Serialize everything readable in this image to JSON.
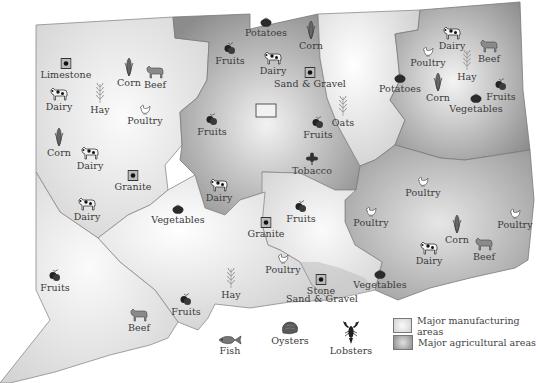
{
  "map": {
    "colors": {
      "manufacturing_fill_center": "#fafafa",
      "manufacturing_fill_edge": "#d0d0d0",
      "agricultural_fill_center": "#eeeeee",
      "agricultural_fill_edge": "#8a8a8a",
      "border": "#888888",
      "label": "#3a3a3a"
    },
    "resources": [
      {
        "label": "Limestone",
        "icon": "mine-square-icon",
        "x": 66,
        "y": 70
      },
      {
        "label": "Corn",
        "icon": "corn-icon",
        "x": 129,
        "y": 78
      },
      {
        "label": "Beef",
        "icon": "cow-beef-icon",
        "x": 155,
        "y": 80
      },
      {
        "label": "Dairy",
        "icon": "cow-dairy-icon",
        "x": 59,
        "y": 102
      },
      {
        "label": "Hay",
        "icon": "wheat-icon",
        "x": 100,
        "y": 105
      },
      {
        "label": "Poultry",
        "icon": "chicken-icon",
        "x": 145,
        "y": 116
      },
      {
        "label": "Corn",
        "icon": "corn-icon",
        "x": 59,
        "y": 148
      },
      {
        "label": "Dairy",
        "icon": "cow-dairy-icon",
        "x": 90,
        "y": 161
      },
      {
        "label": "Granite",
        "icon": "mine-square-icon",
        "x": 133,
        "y": 182
      },
      {
        "label": "Dairy",
        "icon": "cow-dairy-icon",
        "x": 87,
        "y": 212
      },
      {
        "label": "Potatoes",
        "icon": "tomato-icon",
        "x": 266,
        "y": 28
      },
      {
        "label": "Corn",
        "icon": "corn-icon",
        "x": 311,
        "y": 41
      },
      {
        "label": "Fruits",
        "icon": "fruits-icon",
        "x": 230,
        "y": 56
      },
      {
        "label": "Dairy",
        "icon": "cow-dairy-icon",
        "x": 273,
        "y": 66
      },
      {
        "label": "Sand & Gravel",
        "icon": "mine-square-icon",
        "x": 310,
        "y": 79
      },
      {
        "label": "Fruits",
        "icon": "fruits-icon",
        "x": 212,
        "y": 127
      },
      {
        "label": "Oats",
        "icon": "wheat-icon",
        "x": 343,
        "y": 118
      },
      {
        "label": "Fruits",
        "icon": "fruits-icon",
        "x": 318,
        "y": 130
      },
      {
        "label": "Tobacco",
        "icon": "tobacco-leaf-icon",
        "x": 312,
        "y": 166
      },
      {
        "label": "Dairy",
        "icon": "cow-dairy-icon",
        "x": 219,
        "y": 193
      },
      {
        "label": "Vegetables",
        "icon": "tomato-icon",
        "x": 178,
        "y": 215
      },
      {
        "label": "Fruits",
        "icon": "fruits-icon",
        "x": 301,
        "y": 214
      },
      {
        "label": "Granite",
        "icon": "mine-square-icon",
        "x": 266,
        "y": 229
      },
      {
        "label": "Poultry",
        "icon": "chicken-icon",
        "x": 371,
        "y": 218
      },
      {
        "label": "Dairy",
        "icon": "cow-dairy-icon",
        "x": 452,
        "y": 41
      },
      {
        "label": "Beef",
        "icon": "cow-beef-icon",
        "x": 489,
        "y": 54
      },
      {
        "label": "Poultry",
        "icon": "chicken-icon",
        "x": 428,
        "y": 58
      },
      {
        "label": "Hay",
        "icon": "wheat-icon",
        "x": 467,
        "y": 72
      },
      {
        "label": "Potatoes",
        "icon": "tomato-icon",
        "x": 400,
        "y": 84
      },
      {
        "label": "Corn",
        "icon": "corn-icon",
        "x": 438,
        "y": 93
      },
      {
        "label": "Fruits",
        "icon": "fruits-icon",
        "x": 501,
        "y": 92
      },
      {
        "label": "Vegetables",
        "icon": "tomato-icon",
        "x": 476,
        "y": 104
      },
      {
        "label": "Poultry",
        "icon": "chicken-icon",
        "x": 423,
        "y": 188
      },
      {
        "label": "Poultry",
        "icon": "chicken-icon",
        "x": 515,
        "y": 220
      },
      {
        "label": "Corn",
        "icon": "corn-icon",
        "x": 457,
        "y": 235
      },
      {
        "label": "Beef",
        "icon": "cow-beef-icon",
        "x": 484,
        "y": 252
      },
      {
        "label": "Dairy",
        "icon": "cow-dairy-icon",
        "x": 429,
        "y": 256
      },
      {
        "label": "Vegetables",
        "icon": "tomato-icon",
        "x": 380,
        "y": 280
      },
      {
        "label": "Poultry",
        "icon": "chicken-icon",
        "x": 283,
        "y": 265
      },
      {
        "label": "Stone",
        "icon": "mine-square-icon",
        "x": 321,
        "y": 286
      },
      {
        "label": "Sand & Gravel",
        "icon": "",
        "x": 322,
        "y": 294
      },
      {
        "label": "Hay",
        "icon": "wheat-icon",
        "x": 231,
        "y": 290
      },
      {
        "label": "Fruits",
        "icon": "fruits-icon",
        "x": 186,
        "y": 307
      },
      {
        "label": "Fruits",
        "icon": "fruits-icon",
        "x": 55,
        "y": 283
      },
      {
        "label": "Beef",
        "icon": "cow-beef-icon",
        "x": 139,
        "y": 323
      }
    ],
    "marine": [
      {
        "label": "Fish",
        "icon": "fish-icon",
        "x": 230,
        "y": 346
      },
      {
        "label": "Oysters",
        "icon": "oyster-icon",
        "x": 290,
        "y": 336
      },
      {
        "label": "Lobsters",
        "icon": "lobster-icon",
        "x": 351,
        "y": 346
      }
    ],
    "city_marker": {
      "icon": "city-rectangle-icon",
      "x": 266,
      "y": 112
    }
  },
  "legend": {
    "items": [
      {
        "label": "Major manufacturing areas",
        "swatch": "manufacturing"
      },
      {
        "label": "Major agricultural areas",
        "swatch": "agricultural"
      }
    ]
  }
}
